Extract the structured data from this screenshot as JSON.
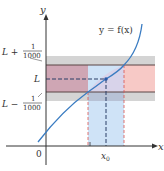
{
  "diagram": {
    "curve_label": "y = f(x)",
    "axes": {
      "x_label": "x",
      "y_label": "y",
      "origin_label": "0",
      "x_tick_label": "x",
      "x_tick_subscript": "0"
    },
    "y_labels": {
      "upper_prefix": "L +",
      "upper_num": "1",
      "upper_den": "1000",
      "middle": "L",
      "lower_prefix": "L −",
      "lower_num": "1",
      "lower_den": "1000"
    },
    "colors": {
      "curve": "#3a7cc2",
      "axis": "#333333",
      "gray_band": "#d4d4d4",
      "pink_band": "#f7c9c6",
      "pink_overlap": "#cfa6b4",
      "blue_band": "#cfe3f7",
      "blue_overlap": "#b7c2d6",
      "bound_line": "#5a4545",
      "red_dash": "#d9534f",
      "dark_dash": "#2b3f66",
      "point": "#2a5aa8"
    }
  }
}
